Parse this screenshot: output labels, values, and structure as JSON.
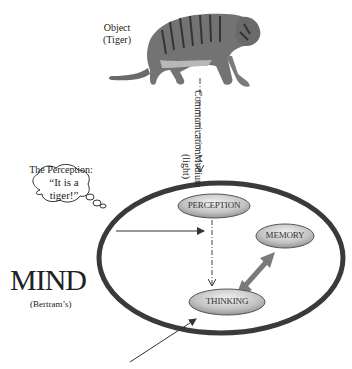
{
  "object": {
    "label_line1": "Object",
    "label_line2": "(Tiger)",
    "image": "tiger-illustration"
  },
  "medium": {
    "line1": "Communication",
    "line2": "Medium (light)"
  },
  "perception_bubble": {
    "title": "The Perception:",
    "line1": "“It is a",
    "line2": "tiger!”"
  },
  "mind": {
    "title": "MIND",
    "subtitle": "(Bertram’s)"
  },
  "nodes": {
    "perception": "PERCEPTION",
    "memory": "MEMORY",
    "thinking": "THINKING"
  },
  "colors": {
    "ellipse_stroke": "#3a3a3a",
    "node_fill_light": "#e6e6e6",
    "node_fill_dark": "#8a8a8a",
    "double_arrow": "#7a7a7a",
    "tiger_body": "#6f6f6f"
  }
}
